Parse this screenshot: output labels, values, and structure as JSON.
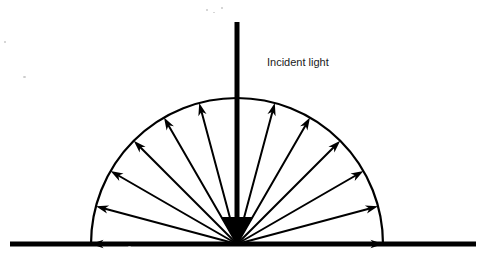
{
  "figure": {
    "title_label": "Incident light",
    "label_x": 267,
    "label_y": 66,
    "font_size": 11,
    "stroke_color": "#000000",
    "background_color": "#ffffff"
  },
  "geometry": {
    "origin_x": 237,
    "origin_y": 244,
    "radius": 146,
    "ground_y": 244,
    "ground_x_start": 10,
    "ground_x_end": 476,
    "ground_thickness": 5,
    "beam_top_y": 22,
    "beam_thickness": 5,
    "arrowhead_half_width": 16,
    "arrowhead_height": 27
  },
  "chart_data": {
    "type": "scatter",
    "xlabel": "",
    "ylabel": "",
    "legend": [],
    "incident_beam": {
      "name": "Incident light",
      "angle_deg": 270,
      "direction": "downward",
      "thickness": 5,
      "terminates_at": "origin"
    },
    "scattered_rays": {
      "count": 12,
      "angle_start_deg": 0,
      "angle_end_deg": 180,
      "angle_step_deg": 15,
      "angles_deg": [
        0,
        15,
        30,
        45,
        60,
        75,
        105,
        120,
        135,
        150,
        165,
        180
      ],
      "length_units": 146,
      "note": "equal-length rays emanating radially from origin, 90 deg omitted (occupied by incident beam)"
    },
    "boundary_arc": {
      "shape": "semicircle",
      "start_angle_deg": 0,
      "end_angle_deg": 180,
      "radius": 146
    },
    "surface": {
      "shape": "horizontal-line",
      "y": 244
    }
  },
  "specks": [
    {
      "x": 206,
      "y": 9,
      "w": 2,
      "h": 2
    },
    {
      "x": 213,
      "y": 12,
      "w": 2,
      "h": 1
    },
    {
      "x": 221,
      "y": 7,
      "w": 2,
      "h": 2
    },
    {
      "x": 4,
      "y": 41,
      "w": 2,
      "h": 2
    },
    {
      "x": 23,
      "y": 76,
      "w": 3,
      "h": 2
    },
    {
      "x": 128,
      "y": 246,
      "w": 3,
      "h": 1
    }
  ]
}
